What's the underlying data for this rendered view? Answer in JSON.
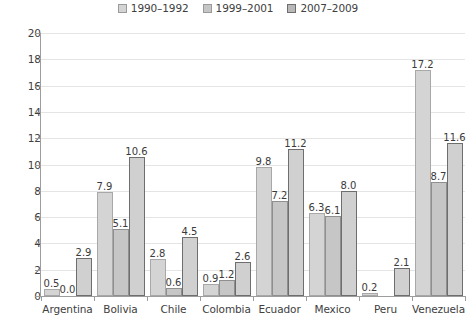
{
  "chart_data": {
    "type": "bar",
    "title": "",
    "xlabel": "",
    "ylabel": "",
    "ylim": [
      0,
      20
    ],
    "yticks": [
      0,
      2,
      4,
      6,
      8,
      10,
      12,
      14,
      16,
      18,
      20
    ],
    "grid": true,
    "legend_position": "top-center",
    "categories": [
      "Argentina",
      "Bolivia",
      "Chile",
      "Colombia",
      "Ecuador",
      "Mexico",
      "Peru",
      "Venezuela"
    ],
    "series": [
      {
        "name": "1990–1992",
        "color": "#d4d4d4",
        "values": [
          0.5,
          7.9,
          2.8,
          0.9,
          9.8,
          6.3,
          0.2,
          17.2
        ],
        "labels": [
          "0.5",
          "7.9",
          "2.8",
          "0.9",
          "9.8",
          "6.3",
          "0.2",
          "17.2"
        ]
      },
      {
        "name": "1999–2001",
        "color": "#c6c6c6",
        "values": [
          0.0,
          5.1,
          0.6,
          1.2,
          7.2,
          6.1,
          null,
          8.7
        ],
        "labels": [
          "0.0",
          "5.1",
          "0.6",
          "1.2",
          "7.2",
          "6.1",
          "",
          "8.7"
        ]
      },
      {
        "name": "2007–2009",
        "color": "#d0d0d0",
        "values": [
          2.9,
          10.6,
          4.5,
          2.6,
          11.2,
          8.0,
          2.1,
          11.6
        ],
        "labels": [
          "2.9",
          "10.6",
          "4.5",
          "2.6",
          "11.2",
          "8.0",
          "2.1",
          "11.6"
        ]
      }
    ]
  }
}
